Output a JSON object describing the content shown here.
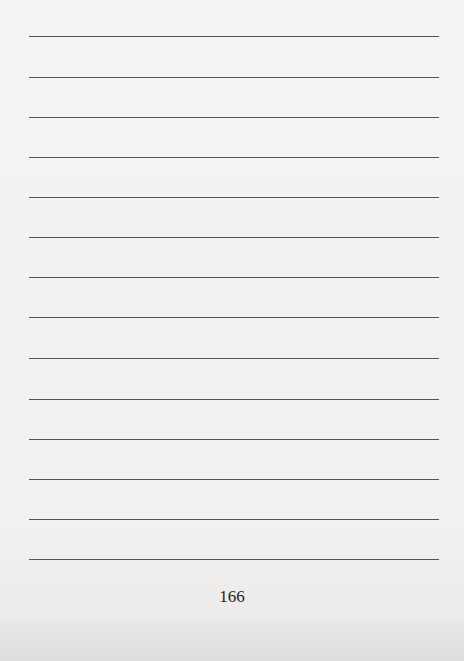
{
  "page": {
    "type": "ruled-notes-page",
    "line_count": 14,
    "line_positions_y": [
      36,
      77,
      117,
      157,
      197,
      237,
      277,
      317,
      358,
      399,
      439,
      479,
      519,
      559
    ],
    "page_number": "166",
    "line_color": "#555555",
    "background_color": "#f3f2f0"
  }
}
